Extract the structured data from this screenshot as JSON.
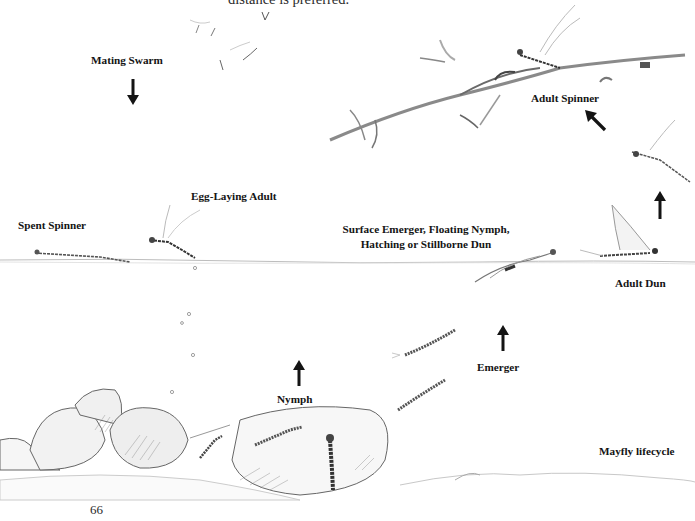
{
  "page": {
    "header_fragment": "distance is preferred.",
    "page_number": "66"
  },
  "diagram": {
    "title": "Mayfly lifecycle",
    "stages": [
      {
        "id": "mating-swarm",
        "label": "Mating Swarm",
        "arrow": "down"
      },
      {
        "id": "adult-spinner",
        "label": "Adult Spinner",
        "arrow": "up-left"
      },
      {
        "id": "egg-laying-adult",
        "label": "Egg-Laying Adult"
      },
      {
        "id": "spent-spinner",
        "label": "Spent Spinner"
      },
      {
        "id": "surface-emerger",
        "label_line1": "Surface Emerger, Floating Nymph,",
        "label_line2": "Hatching or Stillborne Dun"
      },
      {
        "id": "adult-dun",
        "label": "Adult Dun",
        "arrow": "up"
      },
      {
        "id": "emerger",
        "label": "Emerger",
        "arrow": "up"
      },
      {
        "id": "nymph",
        "label": "Nymph",
        "arrow": "up"
      }
    ],
    "colors": {
      "ink": "#141414",
      "pencil": "#8a8a8a",
      "paper": "#ffffff"
    }
  }
}
